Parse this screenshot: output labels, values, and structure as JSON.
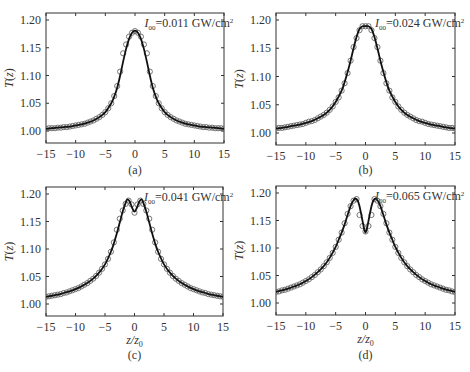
{
  "figure": {
    "panels": [
      "a",
      "b",
      "c",
      "d"
    ]
  },
  "chart_data": [
    {
      "type": "line",
      "panel_label": "(a)",
      "annotation": {
        "symbol": "I",
        "subscript": "00",
        "text": "=0.011 GW/cm",
        "superscript": "2"
      },
      "xlabel": "",
      "ylabel": "T(z)",
      "xlim": [
        -15,
        15
      ],
      "ylim": [
        0.98,
        1.21
      ],
      "xticks": [
        -15,
        -10,
        -5,
        0,
        5,
        10,
        15
      ],
      "xtick_labels": [
        "−15",
        "−10",
        "−5",
        "0",
        "5",
        "10",
        "15"
      ],
      "yticks": [
        1.0,
        1.05,
        1.1,
        1.15,
        1.2
      ],
      "ytick_labels": [
        "1.00",
        "1.05",
        "1.10",
        "1.15",
        "1.20"
      ],
      "grid": false,
      "series": [
        {
          "name": "theory (solid line)",
          "x": [
            -15,
            -14,
            -13,
            -12,
            -11,
            -10,
            -9,
            -8,
            -7,
            -6,
            -5,
            -4,
            -3.5,
            -3,
            -2.5,
            -2,
            -1.5,
            -1,
            -0.5,
            0,
            0.5,
            1,
            1.5,
            2,
            2.5,
            3,
            3.5,
            4,
            5,
            6,
            7,
            8,
            9,
            10,
            11,
            12,
            13,
            14,
            15
          ],
          "y": [
            1.004,
            1.005,
            1.006,
            1.007,
            1.008,
            1.01,
            1.012,
            1.015,
            1.019,
            1.025,
            1.034,
            1.05,
            1.062,
            1.078,
            1.1,
            1.125,
            1.148,
            1.166,
            1.177,
            1.181,
            1.177,
            1.166,
            1.148,
            1.125,
            1.1,
            1.078,
            1.062,
            1.05,
            1.034,
            1.025,
            1.019,
            1.015,
            1.012,
            1.01,
            1.008,
            1.007,
            1.006,
            1.005,
            1.004
          ]
        },
        {
          "name": "experiment (open circles)",
          "x": [
            -15,
            -14.5,
            -14,
            -13.5,
            -13,
            -12.5,
            -12,
            -11.5,
            -11,
            -10.5,
            -10,
            -9.5,
            -9,
            -8.5,
            -8,
            -7.5,
            -7,
            -6.5,
            -6,
            -5.5,
            -5,
            -4.5,
            -4,
            -3.5,
            -3,
            -2.5,
            -2,
            -1.5,
            -1,
            -0.5,
            0,
            0.5,
            1,
            1.5,
            2,
            2.5,
            3,
            3.5,
            4,
            4.5,
            5,
            5.5,
            6,
            6.5,
            7,
            7.5,
            8,
            8.5,
            9,
            9.5,
            10,
            10.5,
            11,
            11.5,
            12,
            12.5,
            13,
            13.5,
            14,
            14.5,
            15
          ],
          "y": [
            1.004,
            1.005,
            1.005,
            1.005,
            1.006,
            1.006,
            1.007,
            1.007,
            1.008,
            1.009,
            1.01,
            1.011,
            1.012,
            1.013,
            1.015,
            1.017,
            1.019,
            1.022,
            1.025,
            1.029,
            1.034,
            1.041,
            1.05,
            1.063,
            1.081,
            1.107,
            1.14,
            1.156,
            1.17,
            1.177,
            1.18,
            1.177,
            1.17,
            1.156,
            1.14,
            1.107,
            1.081,
            1.063,
            1.05,
            1.041,
            1.034,
            1.029,
            1.025,
            1.022,
            1.019,
            1.017,
            1.015,
            1.013,
            1.012,
            1.011,
            1.01,
            1.009,
            1.008,
            1.007,
            1.007,
            1.006,
            1.006,
            1.005,
            1.005,
            1.005,
            1.004
          ]
        }
      ]
    },
    {
      "type": "line",
      "panel_label": "(b)",
      "annotation": {
        "symbol": "I",
        "subscript": "00",
        "text": "=0.024 GW/cm",
        "superscript": "2"
      },
      "xlabel": "",
      "ylabel": "T(z)",
      "xlim": [
        -15,
        15
      ],
      "ylim": [
        0.98,
        1.21
      ],
      "xticks": [
        -15,
        -10,
        -5,
        0,
        5,
        10,
        15
      ],
      "xtick_labels": [
        "−15",
        "−10",
        "−5",
        "0",
        "5",
        "10",
        "15"
      ],
      "yticks": [
        1.0,
        1.05,
        1.1,
        1.15,
        1.2
      ],
      "ytick_labels": [
        "1.00",
        "1.05",
        "1.10",
        "1.15",
        "1.20"
      ],
      "grid": false,
      "series": [
        {
          "name": "theory (solid line)",
          "x": [
            -15,
            -14,
            -13,
            -12,
            -11,
            -10,
            -9,
            -8,
            -7,
            -6,
            -5,
            -4,
            -3.5,
            -3,
            -2.5,
            -2,
            -1.5,
            -1,
            -0.5,
            0,
            0.5,
            1,
            1.5,
            2,
            2.5,
            3,
            3.5,
            4,
            5,
            6,
            7,
            8,
            9,
            10,
            11,
            12,
            13,
            14,
            15
          ],
          "y": [
            1.008,
            1.009,
            1.011,
            1.013,
            1.015,
            1.018,
            1.021,
            1.026,
            1.032,
            1.041,
            1.055,
            1.075,
            1.09,
            1.108,
            1.128,
            1.15,
            1.17,
            1.184,
            1.189,
            1.189,
            1.189,
            1.184,
            1.17,
            1.15,
            1.128,
            1.108,
            1.09,
            1.075,
            1.055,
            1.041,
            1.032,
            1.026,
            1.021,
            1.018,
            1.015,
            1.013,
            1.011,
            1.009,
            1.008
          ]
        },
        {
          "name": "experiment (open circles)",
          "x": [
            -15,
            -14.5,
            -14,
            -13.5,
            -13,
            -12.5,
            -12,
            -11.5,
            -11,
            -10.5,
            -10,
            -9.5,
            -9,
            -8.5,
            -8,
            -7.5,
            -7,
            -6.5,
            -6,
            -5.5,
            -5,
            -4.5,
            -4,
            -3.5,
            -3,
            -2.5,
            -2,
            -1.5,
            -1,
            -0.5,
            0,
            0.5,
            1,
            1.5,
            2,
            2.5,
            3,
            3.5,
            4,
            4.5,
            5,
            5.5,
            6,
            6.5,
            7,
            7.5,
            8,
            8.5,
            9,
            9.5,
            10,
            10.5,
            11,
            11.5,
            12,
            12.5,
            13,
            13.5,
            14,
            14.5,
            15
          ],
          "y": [
            1.008,
            1.009,
            1.009,
            1.01,
            1.011,
            1.012,
            1.013,
            1.014,
            1.015,
            1.016,
            1.018,
            1.02,
            1.021,
            1.023,
            1.026,
            1.029,
            1.032,
            1.036,
            1.041,
            1.047,
            1.055,
            1.063,
            1.075,
            1.088,
            1.106,
            1.128,
            1.152,
            1.168,
            1.182,
            1.189,
            1.189,
            1.189,
            1.182,
            1.168,
            1.152,
            1.128,
            1.106,
            1.088,
            1.075,
            1.063,
            1.055,
            1.047,
            1.041,
            1.036,
            1.032,
            1.029,
            1.026,
            1.023,
            1.021,
            1.02,
            1.018,
            1.016,
            1.015,
            1.014,
            1.013,
            1.012,
            1.011,
            1.01,
            1.009,
            1.009,
            1.008
          ]
        }
      ]
    },
    {
      "type": "line",
      "panel_label": "(c)",
      "annotation": {
        "symbol": "I",
        "subscript": "00",
        "text": "=0.041 GW/cm",
        "superscript": "2"
      },
      "xlabel": "z/z0",
      "ylabel": "T(z)",
      "xlim": [
        -15,
        15
      ],
      "ylim": [
        0.98,
        1.21
      ],
      "xticks": [
        -15,
        -10,
        -5,
        0,
        5,
        10,
        15
      ],
      "xtick_labels": [
        "−15",
        "−10",
        "−5",
        "0",
        "5",
        "10",
        "15"
      ],
      "yticks": [
        1.0,
        1.05,
        1.1,
        1.15,
        1.2
      ],
      "ytick_labels": [
        "1.00",
        "1.05",
        "1.10",
        "1.15",
        "1.20"
      ],
      "grid": false,
      "series": [
        {
          "name": "theory (solid line)",
          "x": [
            -15,
            -14,
            -13,
            -12,
            -11,
            -10,
            -9,
            -8,
            -7,
            -6,
            -5,
            -4,
            -3.5,
            -3,
            -2.5,
            -2,
            -1.5,
            -1.2,
            -0.8,
            -0.4,
            0,
            0.4,
            0.8,
            1.2,
            1.5,
            2,
            2.5,
            3,
            3.5,
            4,
            5,
            6,
            7,
            8,
            9,
            10,
            11,
            12,
            13,
            14,
            15
          ],
          "y": [
            1.013,
            1.015,
            1.017,
            1.02,
            1.023,
            1.027,
            1.032,
            1.038,
            1.046,
            1.057,
            1.072,
            1.095,
            1.11,
            1.128,
            1.148,
            1.168,
            1.184,
            1.19,
            1.186,
            1.175,
            1.168,
            1.175,
            1.186,
            1.19,
            1.184,
            1.168,
            1.148,
            1.128,
            1.11,
            1.095,
            1.072,
            1.057,
            1.046,
            1.038,
            1.032,
            1.027,
            1.023,
            1.02,
            1.017,
            1.015,
            1.013
          ]
        },
        {
          "name": "experiment (open circles)",
          "x": [
            -15,
            -14.5,
            -14,
            -13.5,
            -13,
            -12.5,
            -12,
            -11.5,
            -11,
            -10.5,
            -10,
            -9.5,
            -9,
            -8.5,
            -8,
            -7.5,
            -7,
            -6.5,
            -6,
            -5.5,
            -5,
            -4.5,
            -4,
            -3.5,
            -3,
            -2.5,
            -2,
            -1.5,
            -1,
            -0.5,
            0,
            0.5,
            1,
            1.5,
            2,
            2.5,
            3,
            3.5,
            4,
            4.5,
            5,
            5.5,
            6,
            6.5,
            7,
            7.5,
            8,
            8.5,
            9,
            9.5,
            10,
            10.5,
            11,
            11.5,
            12,
            12.5,
            13,
            13.5,
            14,
            14.5,
            15
          ],
          "y": [
            1.013,
            1.014,
            1.015,
            1.016,
            1.017,
            1.018,
            1.02,
            1.021,
            1.023,
            1.025,
            1.027,
            1.029,
            1.032,
            1.035,
            1.038,
            1.042,
            1.046,
            1.051,
            1.057,
            1.064,
            1.072,
            1.082,
            1.095,
            1.112,
            1.135,
            1.155,
            1.17,
            1.182,
            1.188,
            1.181,
            1.166,
            1.181,
            1.188,
            1.182,
            1.17,
            1.155,
            1.135,
            1.112,
            1.095,
            1.082,
            1.072,
            1.064,
            1.057,
            1.051,
            1.046,
            1.042,
            1.038,
            1.035,
            1.032,
            1.029,
            1.027,
            1.025,
            1.023,
            1.021,
            1.02,
            1.018,
            1.017,
            1.016,
            1.015,
            1.014,
            1.013
          ]
        }
      ]
    },
    {
      "type": "line",
      "panel_label": "(d)",
      "annotation": {
        "symbol": "I",
        "subscript": "00",
        "text": "=0.065 GW/cm",
        "superscript": "2"
      },
      "xlabel": "z/z0",
      "ylabel": "T(z)",
      "xlim": [
        -15,
        15
      ],
      "ylim": [
        0.98,
        1.21
      ],
      "xticks": [
        -15,
        -10,
        -5,
        0,
        5,
        10,
        15
      ],
      "xtick_labels": [
        "−15",
        "−10",
        "−5",
        "0",
        "5",
        "10",
        "15"
      ],
      "yticks": [
        1.0,
        1.05,
        1.1,
        1.15,
        1.2
      ],
      "ytick_labels": [
        "1.00",
        "1.05",
        "1.10",
        "1.15",
        "1.20"
      ],
      "grid": false,
      "series": [
        {
          "name": "theory (solid line)",
          "x": [
            -15,
            -14,
            -13,
            -12,
            -11,
            -10,
            -9,
            -8,
            -7,
            -6,
            -5,
            -4.5,
            -4,
            -3.5,
            -3,
            -2.5,
            -2,
            -1.7,
            -1.3,
            -1,
            -0.6,
            -0.3,
            0,
            0.3,
            0.6,
            1,
            1.3,
            1.7,
            2,
            2.5,
            3,
            3.5,
            4,
            4.5,
            5,
            6,
            7,
            8,
            9,
            10,
            11,
            12,
            13,
            14,
            15
          ],
          "y": [
            1.02,
            1.023,
            1.026,
            1.03,
            1.034,
            1.04,
            1.047,
            1.056,
            1.067,
            1.082,
            1.102,
            1.115,
            1.128,
            1.143,
            1.16,
            1.176,
            1.187,
            1.19,
            1.186,
            1.176,
            1.155,
            1.138,
            1.128,
            1.138,
            1.155,
            1.176,
            1.186,
            1.19,
            1.187,
            1.176,
            1.16,
            1.143,
            1.128,
            1.115,
            1.102,
            1.082,
            1.067,
            1.056,
            1.047,
            1.04,
            1.034,
            1.03,
            1.026,
            1.023,
            1.02
          ]
        },
        {
          "name": "experiment (open circles)",
          "x": [
            -15,
            -14.5,
            -14,
            -13.5,
            -13,
            -12.5,
            -12,
            -11.5,
            -11,
            -10.5,
            -10,
            -9.5,
            -9,
            -8.5,
            -8,
            -7.5,
            -7,
            -6.5,
            -6,
            -5.5,
            -5,
            -4.5,
            -4,
            -3.5,
            -3,
            -2.5,
            -2,
            -1.5,
            -1,
            -0.5,
            0,
            0.5,
            1,
            1.5,
            2,
            2.5,
            3,
            3.5,
            4,
            4.5,
            5,
            5.5,
            6,
            6.5,
            7,
            7.5,
            8,
            8.5,
            9,
            9.5,
            10,
            10.5,
            11,
            11.5,
            12,
            12.5,
            13,
            13.5,
            14,
            14.5,
            15
          ],
          "y": [
            1.02,
            1.021,
            1.023,
            1.024,
            1.026,
            1.028,
            1.03,
            1.032,
            1.034,
            1.037,
            1.04,
            1.043,
            1.047,
            1.051,
            1.056,
            1.061,
            1.067,
            1.074,
            1.082,
            1.091,
            1.102,
            1.115,
            1.128,
            1.145,
            1.162,
            1.176,
            1.186,
            1.189,
            1.16,
            1.14,
            1.13,
            1.14,
            1.16,
            1.189,
            1.186,
            1.176,
            1.162,
            1.145,
            1.128,
            1.115,
            1.102,
            1.091,
            1.082,
            1.074,
            1.067,
            1.061,
            1.056,
            1.051,
            1.047,
            1.043,
            1.04,
            1.037,
            1.034,
            1.032,
            1.03,
            1.028,
            1.026,
            1.024,
            1.023,
            1.021,
            1.02
          ]
        }
      ]
    }
  ]
}
